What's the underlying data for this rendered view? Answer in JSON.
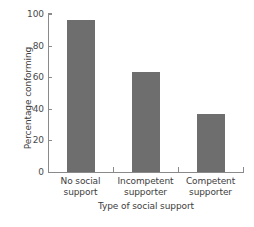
{
  "chart_data": {
    "type": "bar",
    "title": "",
    "subtitle": "",
    "xlabel": "Type of social support",
    "ylabel": "Percentage conforming",
    "categories": [
      "No social support",
      "Incompetent supporter",
      "Competent supporter"
    ],
    "category_lines": [
      [
        "No social",
        "support"
      ],
      [
        "Incompetent",
        "supporter"
      ],
      [
        "Competent",
        "supporter"
      ]
    ],
    "values": [
      96,
      63,
      37
    ],
    "ylim": [
      0,
      100
    ],
    "yticks": [
      0,
      20,
      40,
      60,
      80,
      100
    ],
    "ytick_labels": [
      "0",
      "20",
      "40",
      "60",
      "80",
      "100"
    ],
    "grid": false,
    "legend": false,
    "legend_position": "none",
    "bar_color": "#6e6e6e",
    "axis_color": "#8a8a8a",
    "text_color": "#3d3d3d",
    "background": "#ffffff"
  }
}
